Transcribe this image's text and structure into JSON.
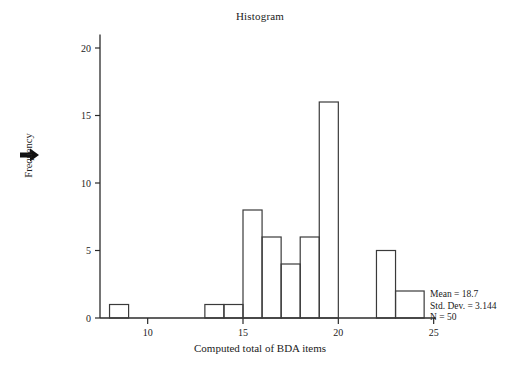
{
  "chart_data": {
    "type": "bar",
    "title": "Histogram",
    "xlabel": "Computed  total of BDA items",
    "ylabel": "Frequency",
    "categories": [
      8,
      13,
      14,
      15,
      16,
      17,
      18,
      19,
      20,
      22,
      23
    ],
    "values": [
      1,
      1,
      1,
      8,
      6,
      4,
      6,
      16,
      0,
      5,
      2
    ],
    "bin_width": 1,
    "bins": [
      {
        "left": 8,
        "right": 9,
        "count": 1
      },
      {
        "left": 13,
        "right": 14,
        "count": 1
      },
      {
        "left": 14,
        "right": 15,
        "count": 1
      },
      {
        "left": 15,
        "right": 16,
        "count": 8
      },
      {
        "left": 16,
        "right": 17,
        "count": 6
      },
      {
        "left": 17,
        "right": 18,
        "count": 4
      },
      {
        "left": 18,
        "right": 19,
        "count": 6
      },
      {
        "left": 19,
        "right": 20,
        "count": 16
      },
      {
        "left": 22,
        "right": 23,
        "count": 5
      },
      {
        "left": 23,
        "right": 24.5,
        "count": 2
      }
    ],
    "xlim": [
      7.5,
      25
    ],
    "ylim": [
      0,
      21
    ],
    "xticks": [
      10,
      15,
      20,
      25
    ],
    "yticks": [
      0,
      5,
      10,
      15,
      20
    ],
    "grid": false,
    "legend": "none",
    "bar_fill": "#ffffff",
    "bar_stroke": "#3a3a3a"
  },
  "annotations": {
    "stats": {
      "mean": "Mean = 18.7",
      "std_dev": "Std. Dev. = 3.144",
      "n": "N = 50"
    },
    "marker": "right-arrow"
  }
}
